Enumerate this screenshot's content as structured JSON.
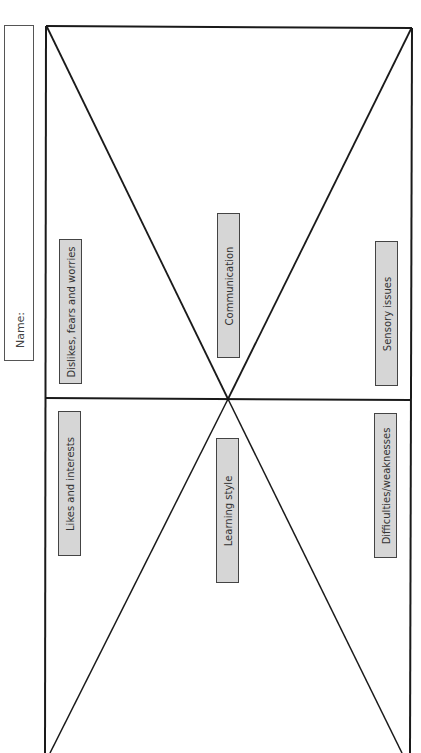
{
  "name_field": {
    "label": "Name:"
  },
  "sections": [
    {
      "id": "dislikes",
      "label": "Dislikes, fears and worries"
    },
    {
      "id": "communication",
      "label": "Communication"
    },
    {
      "id": "sensory",
      "label": "Sensory issues"
    },
    {
      "id": "likes",
      "label": "Likes and interests"
    },
    {
      "id": "learning",
      "label": "Learning style"
    },
    {
      "id": "difficulties",
      "label": "Difficulties/weaknesses"
    }
  ],
  "colors": {
    "line": "#1a1a1a",
    "label_fill": "#d6d6d6",
    "label_border": "#444444"
  }
}
